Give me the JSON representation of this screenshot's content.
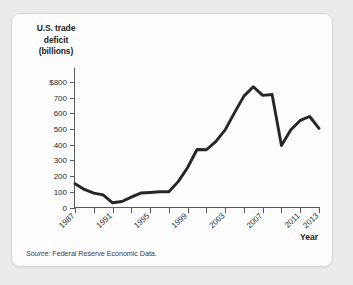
{
  "figure": {
    "source_label": "Source:",
    "source_text": " Federal Reserve Economic Data."
  },
  "chart_data": {
    "type": "line",
    "title": "",
    "ylabel_lines": [
      "U.S. trade",
      "deficit",
      "(billions)"
    ],
    "xlabel": "Year",
    "ylabel": "U.S. trade deficit (billions)",
    "grid": false,
    "legend": "none",
    "xlim": [
      1987,
      2013
    ],
    "ylim": [
      0,
      800
    ],
    "ytick_labels": [
      "$800",
      "700",
      "600",
      "500",
      "400",
      "300",
      "200",
      "100",
      "0"
    ],
    "ytick_values": [
      800,
      700,
      600,
      500,
      400,
      300,
      200,
      100,
      0
    ],
    "xtick_values": [
      1987,
      1989,
      1991,
      1993,
      1995,
      1997,
      1999,
      2001,
      2003,
      2005,
      2007,
      2009,
      2011,
      2013
    ],
    "xtick_labels_shown": [
      "1987",
      "1991",
      "1995",
      "1999",
      "2003",
      "2007",
      "2011",
      "2013"
    ],
    "xtick_labels_shown_values": [
      1987,
      1991,
      1995,
      1999,
      2003,
      2007,
      2011,
      2013
    ],
    "x": [
      1987,
      1988,
      1989,
      1990,
      1991,
      1992,
      1993,
      1994,
      1995,
      1996,
      1997,
      1998,
      1999,
      2000,
      2001,
      2002,
      2003,
      2004,
      2005,
      2006,
      2007,
      2008,
      2009,
      2010,
      2011,
      2012,
      2013
    ],
    "values": [
      152,
      115,
      92,
      80,
      30,
      38,
      66,
      92,
      96,
      100,
      100,
      165,
      255,
      370,
      368,
      420,
      495,
      605,
      710,
      770,
      715,
      720,
      395,
      495,
      555,
      580,
      505
    ],
    "series": [
      {
        "name": "U.S. trade deficit",
        "values": [
          152,
          115,
          92,
          80,
          30,
          38,
          66,
          92,
          96,
          100,
          100,
          165,
          255,
          370,
          368,
          420,
          495,
          605,
          710,
          770,
          715,
          720,
          395,
          495,
          555,
          580,
          505
        ]
      }
    ],
    "line_color": "#262626",
    "peak": {
      "year": 2006,
      "value": 770
    },
    "trough": {
      "year": 1991,
      "value": 30
    }
  }
}
